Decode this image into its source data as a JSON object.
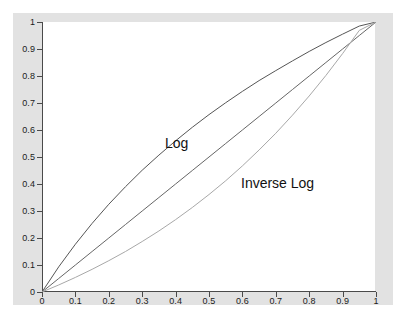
{
  "figure": {
    "background_color": "#e2e2e2",
    "plot_background_color": "#ffffff",
    "page_background_color": "#ffffff",
    "axis_color": "#4a4a4a"
  },
  "annotations": {
    "log_label": "Log",
    "inverse_log_label": "Inverse Log"
  },
  "axis": {
    "x_ticklabels": [
      "0",
      "0.1",
      "0.2",
      "0.3",
      "0.4",
      "0.5",
      "0.6",
      "0.7",
      "0.8",
      "0.9",
      "1"
    ],
    "y_ticklabels": [
      "0",
      "0.1",
      "0.2",
      "0.3",
      "0.4",
      "0.5",
      "0.6",
      "0.7",
      "0.8",
      "0.9",
      "1"
    ]
  },
  "chart_data": {
    "type": "line",
    "title": "",
    "xlabel": "",
    "ylabel": "",
    "xlim": [
      0,
      1
    ],
    "ylim": [
      0,
      1
    ],
    "xticks": [
      0,
      0.1,
      0.2,
      0.3,
      0.4,
      0.5,
      0.6,
      0.7,
      0.8,
      0.9,
      1
    ],
    "yticks": [
      0,
      0.1,
      0.2,
      0.3,
      0.4,
      0.5,
      0.6,
      0.7,
      0.8,
      0.9,
      1
    ],
    "grid": false,
    "legend": "none (inline text annotations)",
    "x": [
      0,
      0.05,
      0.1,
      0.15,
      0.2,
      0.25,
      0.3,
      0.35,
      0.4,
      0.45,
      0.5,
      0.55,
      0.6,
      0.65,
      0.7,
      0.75,
      0.8,
      0.85,
      0.9,
      0.95,
      1
    ],
    "series": [
      {
        "name": "Log",
        "label": "Log",
        "color": "#555555",
        "annotation": "Log",
        "description": "concave curve lying above the diagonal; logarithmic transfer function",
        "values": [
          0,
          0.093,
          0.177,
          0.254,
          0.325,
          0.39,
          0.451,
          0.507,
          0.56,
          0.61,
          0.657,
          0.701,
          0.743,
          0.783,
          0.82,
          0.856,
          0.891,
          0.924,
          0.955,
          0.985,
          1
        ]
      },
      {
        "name": "Linear",
        "label": "",
        "color": "#666666",
        "annotation": "",
        "description": "straight diagonal identity reference line y = x",
        "values": [
          0,
          0.05,
          0.1,
          0.15,
          0.2,
          0.25,
          0.3,
          0.35,
          0.4,
          0.45,
          0.5,
          0.55,
          0.6,
          0.65,
          0.7,
          0.75,
          0.8,
          0.85,
          0.9,
          0.95,
          1
        ]
      },
      {
        "name": "Inverse Log",
        "label": "Inverse Log",
        "color": "#a8a8a8",
        "annotation": "Inverse Log",
        "description": "convex curve lying below the diagonal; inverse logarithmic (exponential) transfer function",
        "values": [
          0,
          0.026,
          0.054,
          0.084,
          0.116,
          0.15,
          0.187,
          0.226,
          0.268,
          0.313,
          0.361,
          0.412,
          0.467,
          0.526,
          0.588,
          0.655,
          0.726,
          0.802,
          0.883,
          0.969,
          1
        ]
      }
    ]
  }
}
